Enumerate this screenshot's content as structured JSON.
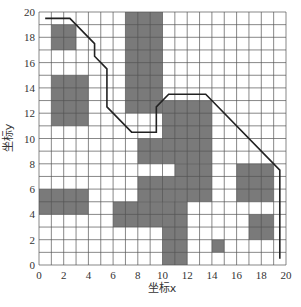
{
  "diagram": {
    "type": "grid-path-planning",
    "grid": {
      "x_min": 0,
      "x_max": 20,
      "y_min": 0,
      "y_max": 20,
      "step": 1
    },
    "x_ticks": [
      "0",
      "2",
      "4",
      "6",
      "8",
      "10",
      "12",
      "14",
      "16",
      "18",
      "20"
    ],
    "y_ticks": [
      "0",
      "2",
      "4",
      "6",
      "8",
      "10",
      "12",
      "14",
      "16",
      "18",
      "20"
    ],
    "x_label": "坐标x",
    "y_label": "坐标y",
    "colors": {
      "obstacle": "#7a7a7a",
      "grid_line": "#555555",
      "path": "#222222",
      "background": "#ffffff"
    },
    "obstacles": [
      {
        "x": 1,
        "y": 17,
        "w": 2,
        "h": 2
      },
      {
        "x": 1,
        "y": 11,
        "w": 3,
        "h": 4
      },
      {
        "x": 7,
        "y": 12,
        "w": 3,
        "h": 8
      },
      {
        "x": 8,
        "y": 8,
        "w": 2,
        "h": 2
      },
      {
        "x": 10,
        "y": 8,
        "w": 4,
        "h": 5
      },
      {
        "x": 0,
        "y": 4,
        "w": 4,
        "h": 2
      },
      {
        "x": 6,
        "y": 3,
        "w": 4,
        "h": 2
      },
      {
        "x": 11,
        "y": 5,
        "w": 3,
        "h": 3
      },
      {
        "x": 8,
        "y": 5,
        "w": 3,
        "h": 2
      },
      {
        "x": 10,
        "y": 0,
        "w": 2,
        "h": 5
      },
      {
        "x": 16,
        "y": 5,
        "w": 3,
        "h": 3
      },
      {
        "x": 17,
        "y": 2,
        "w": 2,
        "h": 2
      },
      {
        "x": 14,
        "y": 1,
        "w": 1,
        "h": 1
      }
    ],
    "path": [
      [
        0.5,
        19.5
      ],
      [
        2.5,
        19.5
      ],
      [
        4.5,
        17.5
      ],
      [
        4.5,
        16.5
      ],
      [
        5.5,
        15.5
      ],
      [
        5.5,
        12.5
      ],
      [
        7.5,
        10.5
      ],
      [
        9.5,
        10.5
      ],
      [
        9.5,
        12.5
      ],
      [
        10.5,
        13.5
      ],
      [
        13.5,
        13.5
      ],
      [
        19.5,
        7.5
      ],
      [
        19.5,
        0.5
      ]
    ]
  }
}
